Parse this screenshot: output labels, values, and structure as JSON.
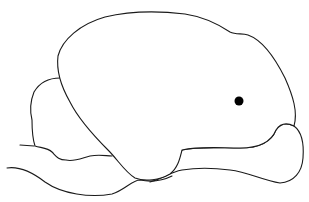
{
  "figure": {
    "parts": [
      "cerebrum",
      "cerebellum",
      "brainstem",
      "olfactory-region"
    ],
    "marker": {
      "type": "stippled-spot",
      "center": [
        239,
        101
      ],
      "radius": 34,
      "core_radius": 5
    },
    "colors": {
      "line": "#1a1a1a",
      "background": "#ffffff",
      "marker": "#000000"
    }
  }
}
